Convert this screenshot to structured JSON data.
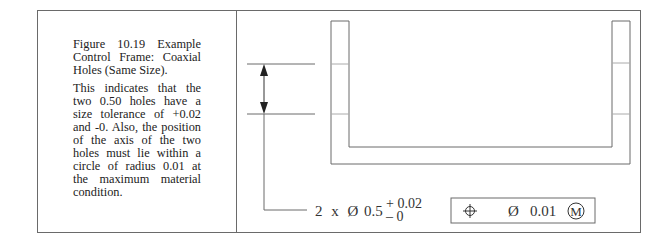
{
  "caption": {
    "title": "Figure 10.19 Example Control Frame: Coaxial Holes (Same Size).",
    "body": "This indicates that the two 0.50 holes have a size tolerance of +0.02 and -0. Also, the position of the axis of the two holes must lie within a circle of radius 0.01 at the maximum material condition."
  },
  "drawing": {
    "size_callout": {
      "count": "2",
      "times": "x",
      "diameter_symbol": "Ø",
      "nominal": "0.5",
      "upper_tolerance": "+ 0.02",
      "lower_tolerance": "– 0"
    },
    "feature_control_frame": {
      "characteristic_icon": "position-icon",
      "diameter_symbol": "Ø",
      "tolerance": "0.01",
      "modifier": "M"
    }
  },
  "colors": {
    "line": "#6a6a6a",
    "text": "#222222"
  }
}
